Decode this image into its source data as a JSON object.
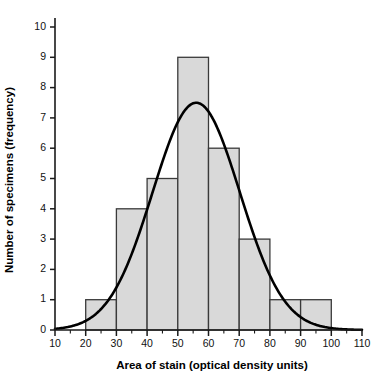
{
  "chart_data": {
    "type": "bar",
    "title": "",
    "xlabel": "Area of stain (optical density units)",
    "ylabel": "Number of specimens (frequency)",
    "xlim": [
      10,
      110
    ],
    "ylim": [
      0,
      10
    ],
    "xticks": [
      10,
      20,
      30,
      40,
      50,
      60,
      70,
      80,
      90,
      100,
      110
    ],
    "yticks": [
      0,
      1,
      2,
      3,
      4,
      5,
      6,
      7,
      8,
      9,
      10
    ],
    "xtick_labels": [
      "10",
      "20",
      "30",
      "40",
      "50",
      "60",
      "70",
      "80",
      "90",
      "100",
      "110"
    ],
    "ytick_labels": [
      "0",
      "1",
      "2",
      "3",
      "4",
      "5",
      "6",
      "7",
      "8",
      "9",
      "10"
    ],
    "minor_tick_step": 5,
    "grid": false,
    "legend": "none",
    "bin_width": 10,
    "bin_edges": [
      10,
      20,
      30,
      40,
      50,
      60,
      70,
      80,
      90,
      100,
      110
    ],
    "categories": [
      "10-20",
      "20-30",
      "30-40",
      "40-50",
      "50-60",
      "60-70",
      "70-80",
      "80-90",
      "90-100",
      "100-110"
    ],
    "values": [
      0,
      1,
      4,
      5,
      9,
      6,
      3,
      1,
      1,
      0
    ],
    "bar_fill_color": "#d9d9d9",
    "bar_edge_color": "#3a3a3a",
    "overlay": {
      "name": "normal-fit-curve",
      "type": "line",
      "color": "#000000",
      "peak_x": 56,
      "peak_y": 7.5,
      "mean": 56,
      "sd": 14.2,
      "amplitude": 7.5,
      "x_start": 10,
      "x_end": 110
    }
  },
  "chart": {
    "xlabel": "Area of stain (optical density units)",
    "ylabel": "Number of specimens (frequency)"
  }
}
